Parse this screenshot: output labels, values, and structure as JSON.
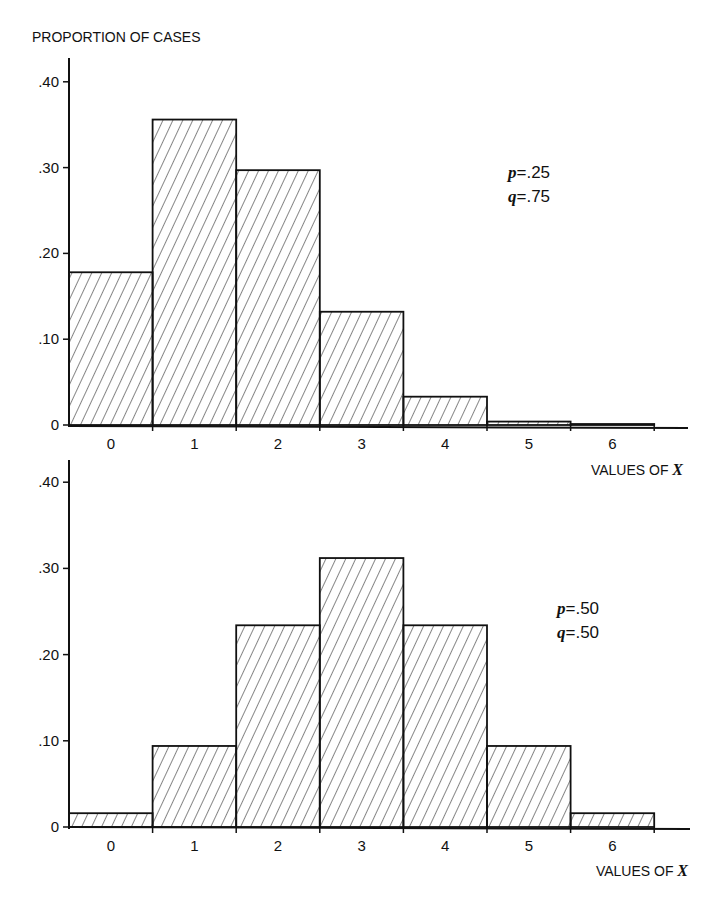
{
  "chart_data": [
    {
      "type": "bar",
      "title": "",
      "ylabel": "PROPORTION OF CASES",
      "xlabel": "VALUES OF X",
      "categories": [
        "0",
        "1",
        "2",
        "3",
        "4",
        "5",
        "6"
      ],
      "values": [
        0.178,
        0.356,
        0.297,
        0.132,
        0.033,
        0.004,
        0.0002
      ],
      "ylim": [
        0,
        0.42
      ],
      "yticks": [
        "0",
        ".10",
        ".20",
        ".30",
        ".40"
      ],
      "annotation": [
        "p = .25",
        "q = .75"
      ],
      "grid": false,
      "style": "hatched histogram"
    },
    {
      "type": "bar",
      "title": "",
      "ylabel": "",
      "xlabel": "VALUES OF X",
      "categories": [
        "0",
        "1",
        "2",
        "3",
        "4",
        "5",
        "6"
      ],
      "values": [
        0.016,
        0.094,
        0.234,
        0.312,
        0.234,
        0.094,
        0.016
      ],
      "ylim": [
        0,
        0.42
      ],
      "yticks": [
        "0",
        ".10",
        ".20",
        ".30",
        ".40"
      ],
      "annotation": [
        "p = .50",
        "q = .50"
      ],
      "grid": false,
      "style": "hatched histogram"
    }
  ],
  "top": {
    "ylabel": "PROPORTION OF CASES",
    "xlabel_prefix": "VALUES OF ",
    "xlabel_var": "X",
    "p_var": "p",
    "p_val": "=.25",
    "q_var": "q",
    "q_val": "=.75",
    "yticks": [
      "0",
      ".10",
      ".20",
      ".30",
      ".40"
    ],
    "xticks": [
      "0",
      "1",
      "2",
      "3",
      "4",
      "5",
      "6"
    ]
  },
  "bottom": {
    "xlabel_prefix": "VALUES OF ",
    "xlabel_var": "X",
    "p_var": "p",
    "p_val": "=.50",
    "q_var": "q",
    "q_val": "=.50",
    "yticks": [
      "0",
      ".10",
      ".20",
      ".30",
      ".40"
    ],
    "xticks": [
      "0",
      "1",
      "2",
      "3",
      "4",
      "5",
      "6"
    ]
  },
  "colors": {
    "ink": "#111111",
    "background": "#ffffff"
  }
}
